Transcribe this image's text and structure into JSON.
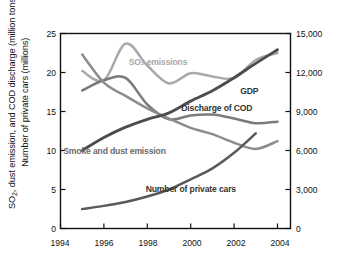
{
  "chart_data": {
    "type": "line",
    "title": "",
    "xlabel": "",
    "ylabel": "SO2, dust emission, and COD discharge (million tons) Number of private cars (millions)",
    "ylabel_right": "GDP (billion yuan RMB)",
    "x": [
      1995,
      1996,
      1997,
      1998,
      1999,
      2000,
      2001,
      2002,
      2003,
      2004
    ],
    "xlim": [
      1994,
      2004.6
    ],
    "ylim": [
      0,
      25
    ],
    "ylim_right": [
      0,
      15000
    ],
    "xticks": [
      "1994",
      "1996",
      "1998",
      "2000",
      "2002",
      "2004"
    ],
    "xtick_values": [
      1994,
      1996,
      1998,
      2000,
      2002,
      2004
    ],
    "yticks": [
      "0",
      "5",
      "10",
      "15",
      "20",
      "25"
    ],
    "ytick_values": [
      0,
      5,
      10,
      15,
      20,
      25
    ],
    "yticks_right": [
      "0",
      "3,000",
      "6,000",
      "9,000",
      "12,000",
      "15,000"
    ],
    "ytick_values_right": [
      0,
      3000,
      6000,
      9000,
      12000,
      15000
    ],
    "grid": false,
    "legend": "inline-labels",
    "series": [
      {
        "name": "SO2 emissions",
        "label": "SO₂ emissions",
        "axis": "left",
        "color": "#a9a9a9",
        "units": "million tons",
        "x": [
          1995,
          1996,
          1997,
          1998,
          1999,
          2000,
          2001,
          2002,
          2003,
          2004
        ],
        "values": [
          20.2,
          19.0,
          23.7,
          20.9,
          18.6,
          19.9,
          19.5,
          19.3,
          21.6,
          22.5
        ]
      },
      {
        "name": "Discharge of COD",
        "label": "Discharge of COD",
        "axis": "left",
        "color": "#7a7a7a",
        "units": "million tons",
        "x": [
          1995,
          1996,
          1997,
          1998,
          1999,
          2000,
          2001,
          2002,
          2003,
          2004
        ],
        "values": [
          17.7,
          19.0,
          19.3,
          15.9,
          14.0,
          14.5,
          14.6,
          14.1,
          13.5,
          13.7
        ]
      },
      {
        "name": "Smoke and dust emission",
        "label": "Smoke and dust emission",
        "axis": "left",
        "color": "#8c8c8c",
        "units": "million tons",
        "x": [
          1995,
          1996,
          1997,
          1998,
          1999,
          2000,
          2001,
          2002,
          2003,
          2004
        ],
        "values": [
          22.3,
          18.7,
          17.0,
          15.4,
          14.1,
          12.9,
          12.1,
          11.0,
          10.2,
          11.2
        ]
      },
      {
        "name": "GDP",
        "label": "GDP",
        "axis": "right",
        "color": "#4d4d4d",
        "units": "billion yuan RMB",
        "x": [
          1995,
          1996,
          1997,
          1998,
          1999,
          2000,
          2001,
          2002,
          2003,
          2004
        ],
        "values": [
          6000,
          7000,
          7800,
          8400,
          8900,
          9800,
          10600,
          11600,
          12700,
          13750
        ]
      },
      {
        "name": "Number of private cars",
        "label": "Number of private cars",
        "axis": "left",
        "color": "#595959",
        "units": "millions",
        "x": [
          1995,
          1996,
          1997,
          1998,
          1999,
          2000,
          2001,
          2002,
          2003
        ],
        "values": [
          2.5,
          2.9,
          3.4,
          4.1,
          5.0,
          6.3,
          7.7,
          9.7,
          12.2
        ]
      }
    ],
    "annotations": [
      {
        "text": "SO₂ emissions",
        "x": 1998.5,
        "y": 21.4,
        "color": "#a9a9a9"
      },
      {
        "text": "GDP",
        "x": 2002.7,
        "y": 17.6,
        "color": "#333333"
      },
      {
        "text": "Discharge of COD",
        "x": 2001.2,
        "y": 15.4,
        "color": "#333333"
      },
      {
        "text": "Smoke and dust emission",
        "x": 1996.5,
        "y": 9.9,
        "color": "#6b6b6b"
      },
      {
        "text": "Number of private cars",
        "x": 2000.0,
        "y": 5.1,
        "color": "#333333"
      }
    ]
  },
  "axes": {
    "left_title_line1": "SO",
    "left_title_sub1": "2",
    "left_title_line1b": ", dust emission, and COD discharge (million tons)",
    "left_title_line2": "Number of private cars (millions)",
    "right_title": "GDP (billion yuan RMB)"
  }
}
